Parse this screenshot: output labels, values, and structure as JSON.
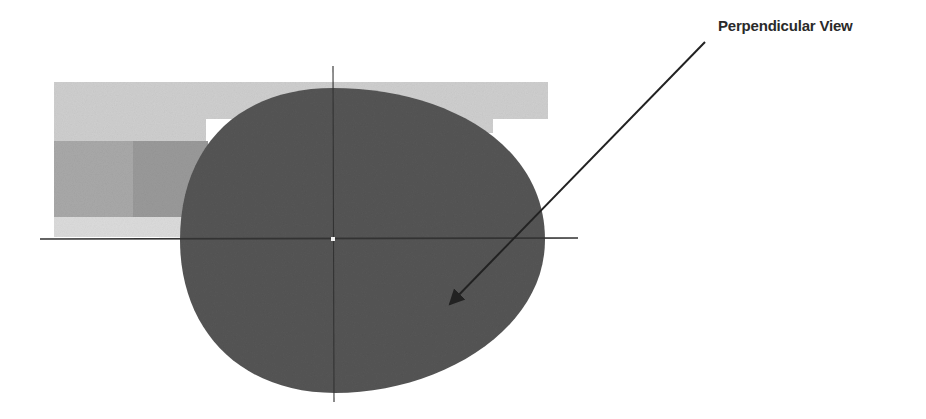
{
  "diagram": {
    "annotation": {
      "label": "Perpendicular View",
      "arrow_from": [
        705,
        42
      ],
      "arrow_to": [
        446,
        308
      ]
    },
    "colors": {
      "background": "#ffffff",
      "outer_band": "#cfcfcf",
      "lower_band": "#dcdcdc",
      "mid_band_left": "#a9a9a9",
      "mid_band_right": "#9a9a9a",
      "ellipse": "#555555",
      "axis": "#333333",
      "arrow": "#222222",
      "label": "#2a2a2a"
    },
    "axes": {
      "origin": [
        333,
        239
      ],
      "horizontal": {
        "x1": 40,
        "x2": 578
      },
      "vertical": {
        "y1": 66,
        "y2": 402
      }
    },
    "ellipse": {
      "left": 180,
      "right": 545,
      "top": 88,
      "bottom": 393
    }
  }
}
